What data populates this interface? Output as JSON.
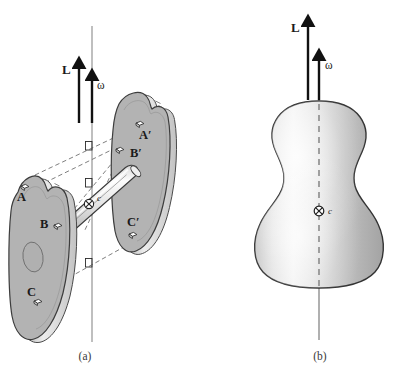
{
  "figure": {
    "background_color": "#ffffff",
    "ink_color": "#1a1a1a",
    "disc_fill_color": "#b3b3b3",
    "disc_edge_color": "#d8d8d8",
    "body_fill_light": "#f2f2f2",
    "body_fill_mid": "#c9c9c9",
    "body_fill_dark": "#9a9a9a",
    "rod_fill_light": "#fafafa",
    "rod_fill_dark": "#b8b8b8",
    "dash_color": "#6e6e6e"
  },
  "panel_a": {
    "caption": "(a)",
    "vectors": {
      "angular_momentum": "L",
      "angular_velocity": "ω"
    },
    "center_of_mass": {
      "marker": "cross-circle-icon",
      "label": "c"
    },
    "near_disc_points": [
      {
        "label": "A",
        "marker": "point-marker-icon"
      },
      {
        "label": "B",
        "marker": "point-marker-icon"
      },
      {
        "label": "C",
        "marker": "point-marker-icon"
      }
    ],
    "far_disc_points": [
      {
        "label": "A′",
        "marker": "point-marker-icon"
      },
      {
        "label": "B′",
        "marker": "point-marker-icon"
      },
      {
        "label": "C′",
        "marker": "point-marker-icon"
      }
    ],
    "right_angle_markers": 3,
    "parts": {
      "near_disc": "near-disc",
      "far_disc": "far-disc",
      "connecting_rod": "connecting-rod",
      "rotation_axis": "rotation-axis"
    }
  },
  "panel_b": {
    "caption": "(b)",
    "vectors": {
      "angular_momentum": "L",
      "angular_velocity": "ω"
    },
    "center_of_mass": {
      "marker": "cross-circle-icon",
      "label": "c"
    },
    "parts": {
      "body": "gourd-shaped-body",
      "symmetry_axis": "dashed-symmetry-axis",
      "rotation_axis": "rotation-axis"
    }
  }
}
